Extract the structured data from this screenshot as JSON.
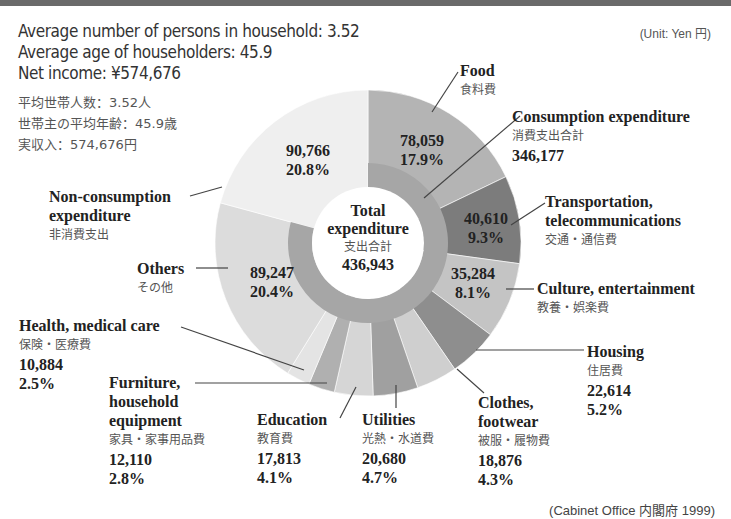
{
  "header": {
    "persons": "Average number of persons in household: 3.52",
    "age": "Average age of householders: 45.9",
    "income": "Net income: ¥574,676",
    "persons_jp": "平均世帯人数：3.52人",
    "age_jp": "世帯主の平均年齢：45.9歳",
    "income_jp": "実収入：574,676円",
    "unit": "(Unit: Yen 円)"
  },
  "center": {
    "line1": "Total",
    "line2": "expenditure",
    "jp": "支出合計",
    "value": "436,943"
  },
  "consumption": {
    "label": "Consumption expenditure",
    "jp": "消費支出合計",
    "value": "346,177"
  },
  "slices": {
    "food": {
      "label": "Food",
      "jp": "食料費",
      "value": "78,059",
      "pct": "17.9%"
    },
    "transport": {
      "label1": "Transportation,",
      "label2": "telecommunications",
      "jp": "交通・通信費",
      "value": "40,610",
      "pct": "9.3%"
    },
    "culture": {
      "label": "Culture, entertainment",
      "jp": "教養・娯楽費",
      "value": "35,284",
      "pct": "8.1%"
    },
    "housing": {
      "label": "Housing",
      "jp": "住居費",
      "value": "22,614",
      "pct": "5.2%"
    },
    "clothes": {
      "label1": "Clothes,",
      "label2": "footwear",
      "jp": "被服・履物費",
      "value": "18,876",
      "pct": "4.3%"
    },
    "utilities": {
      "label": "Utilities",
      "jp": "光熱・水道費",
      "value": "20,680",
      "pct": "4.7%"
    },
    "education": {
      "label": "Education",
      "jp": "教育費",
      "value": "17,813",
      "pct": "4.1%"
    },
    "furniture": {
      "label1": "Furniture,",
      "label2": "household",
      "label3": "equipment",
      "jp": "家具・家事用品費",
      "value": "12,110",
      "pct": "2.8%"
    },
    "health": {
      "label": "Health, medical care",
      "jp": "保険・医療費",
      "value": "10,884",
      "pct": "2.5%"
    },
    "others": {
      "label": "Others",
      "jp": "その他",
      "value": "89,247",
      "pct": "20.4%"
    },
    "nonconsumption": {
      "label1": "Non-consumption",
      "label2": "expenditure",
      "jp": "非消費支出",
      "value": "90,766",
      "pct": "20.8%"
    }
  },
  "source": "(Cabinet Office 内閣府 1999)",
  "chart_data": {
    "type": "pie",
    "title": "Total expenditure 支出合計 436,943",
    "unit": "Yen",
    "categories": [
      "Food",
      "Transportation, telecommunications",
      "Culture, entertainment",
      "Housing",
      "Clothes, footwear",
      "Utilities",
      "Education",
      "Furniture, household equipment",
      "Health, medical care",
      "Others",
      "Non-consumption expenditure"
    ],
    "values": [
      78059,
      40610,
      35284,
      22614,
      18876,
      20680,
      17813,
      12110,
      10884,
      89247,
      90766
    ],
    "percentages": [
      17.9,
      9.3,
      8.1,
      5.2,
      4.3,
      4.7,
      4.1,
      2.8,
      2.5,
      20.4,
      20.8
    ],
    "colors": [
      "#b4b4b4",
      "#7c7c7c",
      "#c4c4c4",
      "#8e8e8e",
      "#cfcfcf",
      "#a0a0a0",
      "#d6d6d6",
      "#b0b0b0",
      "#e4e4e4",
      "#dcdcdc",
      "#efefef"
    ],
    "inner_ring": {
      "label": "Consumption expenditure",
      "value": 346177,
      "covers": "all except Non-consumption expenditure",
      "color": "#a6a6a6"
    },
    "total": 436943,
    "annotations": [
      "Average number of persons in household: 3.52",
      "Average age of householders: 45.9",
      "Net income: ¥574,676",
      "(Unit: Yen 円)",
      "(Cabinet Office 内閣府 1999)"
    ]
  }
}
